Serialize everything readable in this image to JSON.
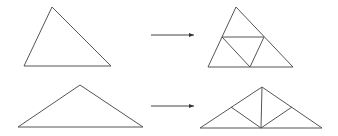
{
  "diagram": {
    "colors": {
      "stroke": "#555555",
      "background": "#ffffff"
    },
    "rows": [
      {
        "name": "row-1",
        "source_triangle": [
          [
            52,
            7
          ],
          [
            24,
            66
          ],
          [
            111,
            66
          ]
        ],
        "arrow": {
          "from": [
            151,
            35
          ],
          "to": [
            194,
            35
          ]
        },
        "result_triangle": [
          [
            236,
            7
          ],
          [
            208,
            67
          ],
          [
            293,
            67
          ]
        ],
        "subdivision_lines": [
          [
            [
              222,
              37
            ],
            [
              264,
              37
            ]
          ],
          [
            [
              222,
              37
            ],
            [
              250,
              67
            ]
          ],
          [
            [
              264,
              37
            ],
            [
              250,
              67
            ]
          ]
        ]
      },
      {
        "name": "row-2",
        "source_triangle": [
          [
            80,
            85
          ],
          [
            18,
            127
          ],
          [
            143,
            127
          ]
        ],
        "arrow": {
          "from": [
            151,
            106
          ],
          "to": [
            194,
            106
          ]
        },
        "result_triangle": [
          [
            262,
            87
          ],
          [
            200,
            128
          ],
          [
            322,
            128
          ]
        ],
        "subdivision_lines": [
          [
            [
              262,
              87
            ],
            [
              261,
              128
            ]
          ],
          [
            [
              231,
              107
            ],
            [
              261,
              128
            ]
          ],
          [
            [
              292,
              107
            ],
            [
              261,
              128
            ]
          ]
        ]
      }
    ]
  }
}
